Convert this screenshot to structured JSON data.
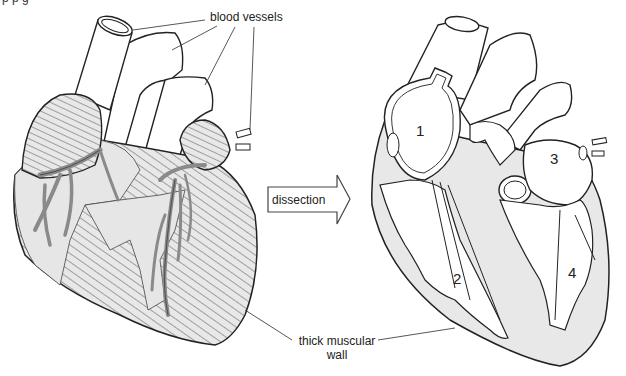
{
  "figure": {
    "top_cut_text": "p         p    g",
    "left_panel": {
      "name": "external heart view"
    },
    "right_panel": {
      "name": "dissected heart view"
    },
    "labels": {
      "blood_vessels": "blood vessels",
      "dissection": "dissection",
      "thick_muscular_wall_line1": "thick muscular",
      "thick_muscular_wall_line2": "wall"
    },
    "chamber_numbers": [
      "1",
      "2",
      "3",
      "4"
    ],
    "colors": {
      "outline": "#222222",
      "muscle_fill": "#e6e6e6",
      "vessel_fill": "#8a8a8a",
      "interior_fill": "#ffffff",
      "wall_fill": "#e8e8e8"
    }
  }
}
